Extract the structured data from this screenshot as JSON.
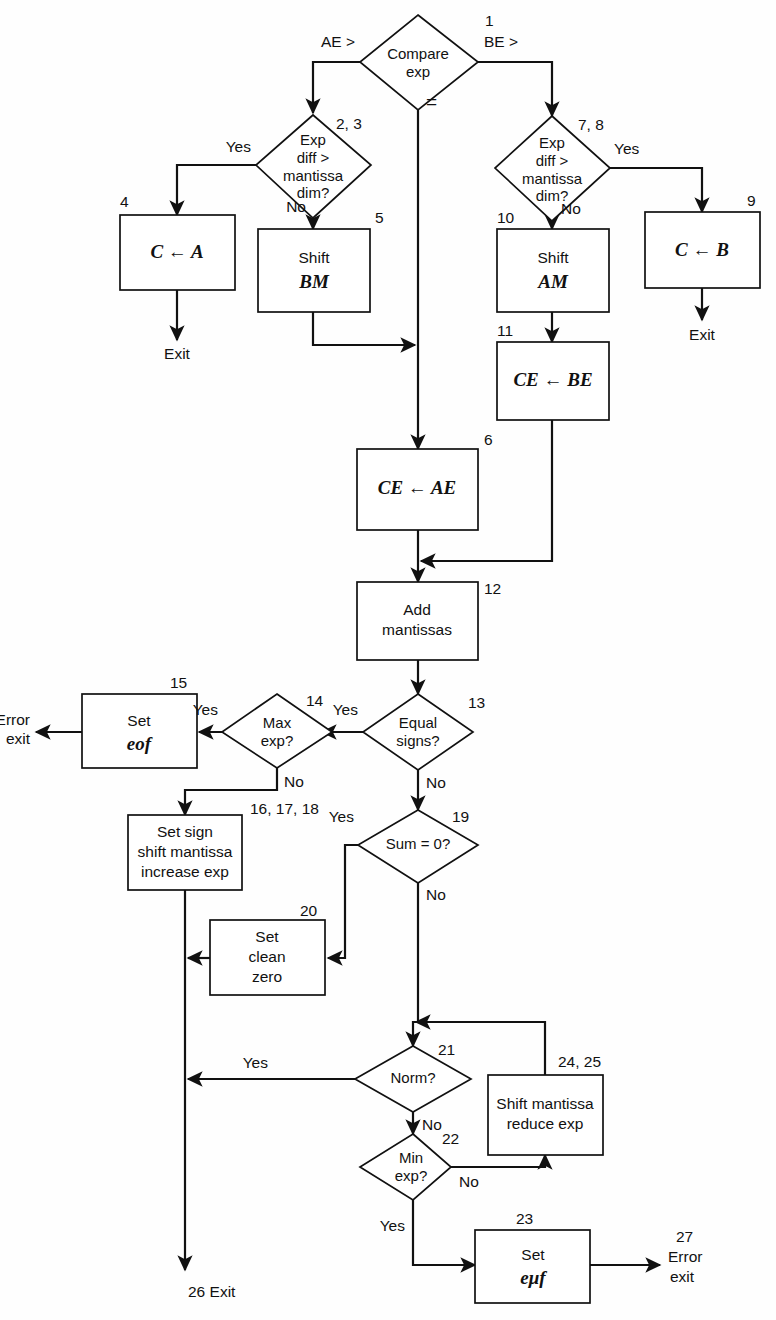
{
  "diagram": {
    "nodes": {
      "n1": {
        "number": "1",
        "line1": "Compare",
        "line2": "exp"
      },
      "n23": {
        "number": "2, 3",
        "line1": "Exp",
        "line2": "diff >",
        "line3": "mantissa",
        "line4": "dim?"
      },
      "n4": {
        "number": "4",
        "line1": "C ← A"
      },
      "n5": {
        "number": "5",
        "line1": "Shift",
        "line2": "BM"
      },
      "n78": {
        "number": "7, 8",
        "line1": "Exp",
        "line2": "diff >",
        "line3": "mantissa",
        "line4": "dim?"
      },
      "n9": {
        "number": "9",
        "line1": "C ← B"
      },
      "n10": {
        "number": "10",
        "line1": "Shift",
        "line2": "AM"
      },
      "n11": {
        "number": "11",
        "line1": "CE ← BE"
      },
      "n6": {
        "number": "6",
        "line1": "CE ← AE"
      },
      "n12": {
        "number": "12",
        "line1": "Add",
        "line2": "mantissas"
      },
      "n13": {
        "number": "13",
        "line1": "Equal",
        "line2": "signs?"
      },
      "n14": {
        "number": "14",
        "line1": "Max",
        "line2": "exp?"
      },
      "n15": {
        "number": "15",
        "line1": "Set",
        "line2": "eof"
      },
      "n161718": {
        "number": "16, 17, 18",
        "line1": "Set sign",
        "line2": "shift mantissa",
        "line3": "increase exp"
      },
      "n19": {
        "number": "19",
        "line1": "Sum = 0?"
      },
      "n20": {
        "number": "20",
        "line1": "Set",
        "line2": "clean",
        "line3": "zero"
      },
      "n21": {
        "number": "21",
        "line1": "Norm?"
      },
      "n22": {
        "number": "22",
        "line1": "Min",
        "line2": "exp?"
      },
      "n2425": {
        "number": "24, 25",
        "line1": "Shift mantissa",
        "line2": "reduce exp"
      },
      "n23b": {
        "number": "23",
        "line1": "Set",
        "line2": "eμf"
      }
    },
    "edge_labels": {
      "ae_greater": "AE >",
      "be_greater": "BE >",
      "equal": "=",
      "yes_left_23": "Yes",
      "no_23": "No",
      "yes_right_78": "Yes",
      "no_78": "No",
      "yes_13": "Yes",
      "no_13": "No",
      "yes_14": "Yes",
      "no_14": "No",
      "yes_19": "Yes",
      "no_19": "No",
      "yes_21": "Yes",
      "no_21": "No",
      "no_22": "No",
      "yes_22": "Yes"
    },
    "terminals": {
      "exit_left": "Exit",
      "exit_right": "Exit",
      "error_exit_top": {
        "line1": "Error",
        "line2": "exit"
      },
      "exit_26": "26 Exit",
      "error_exit_27": {
        "number": "27",
        "line1": "Error",
        "line2": "exit"
      }
    },
    "colors": {
      "stroke": "#111111",
      "fill": "#ffffff",
      "background": "#fefefe"
    }
  }
}
